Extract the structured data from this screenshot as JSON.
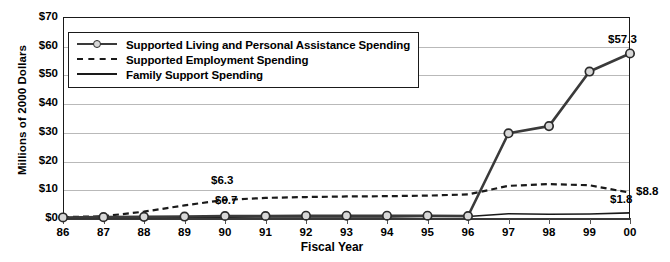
{
  "chart_data": {
    "type": "line",
    "title": "",
    "xlabel": "Fiscal Year",
    "ylabel": "Millions of 2000 Dollars",
    "categories": [
      "86",
      "87",
      "88",
      "89",
      "90",
      "91",
      "92",
      "93",
      "94",
      "95",
      "96",
      "97",
      "98",
      "99",
      "00"
    ],
    "ylim": [
      0,
      70
    ],
    "ytick_labels": [
      "$0",
      "$10",
      "$20",
      "$30",
      "$40",
      "$50",
      "$60",
      "$70"
    ],
    "ytick_values": [
      0,
      10,
      20,
      30,
      40,
      50,
      60,
      70
    ],
    "grid": true,
    "legend_position": "top-left",
    "series": [
      {
        "name": "Supported Living and Personal Assistance Spending",
        "style": "solid-marker",
        "values": [
          0.2,
          0.3,
          0.4,
          0.5,
          0.7,
          0.7,
          0.8,
          0.8,
          0.8,
          0.8,
          0.7,
          29.5,
          32.0,
          51.0,
          57.3
        ]
      },
      {
        "name": "Supported Employment Spending",
        "style": "dashed",
        "values": [
          0.3,
          0.6,
          2.2,
          4.4,
          6.3,
          7.0,
          7.3,
          7.5,
          7.6,
          7.8,
          8.2,
          11.2,
          11.8,
          11.4,
          8.8
        ]
      },
      {
        "name": "Family Support Spending",
        "style": "solid",
        "values": [
          0.1,
          0.2,
          0.2,
          0.3,
          0.3,
          0.4,
          0.4,
          0.4,
          0.4,
          0.5,
          0.5,
          1.5,
          1.3,
          1.4,
          1.8
        ]
      }
    ],
    "annotations": [
      {
        "text": "$6.3",
        "series": "Supported Employment Spending",
        "category": "90"
      },
      {
        "text": "$0.7",
        "series": "Supported Living and Personal Assistance Spending",
        "category": "90"
      },
      {
        "text": "$57.3",
        "series": "Supported Living and Personal Assistance Spending",
        "category": "00"
      },
      {
        "text": "$8.8",
        "series": "Supported Employment Spending",
        "category": "00"
      },
      {
        "text": "$1.8",
        "series": "Family Support Spending",
        "category": "00"
      }
    ]
  },
  "legend": {
    "items": [
      {
        "label": "Supported Living and Personal Assistance Spending",
        "key": "line-circle-marker-key"
      },
      {
        "label": "Supported Employment Spending",
        "key": "dashed-line-key"
      },
      {
        "label": "Family Support Spending",
        "key": "solid-line-key"
      }
    ]
  },
  "colors": {
    "series_main": "#3a3a3a",
    "series_dashed": "#1a1a1a",
    "series_solid": "#1a1a1a",
    "gridline": "#b9b9b9",
    "axis": "#1a1a1a",
    "marker_fill": "#d8d8d8",
    "background": "#ffffff"
  }
}
